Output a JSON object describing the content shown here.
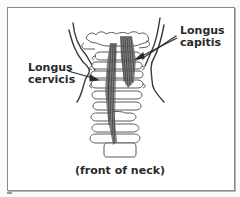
{
  "figure": {
    "type": "anatomical-illustration",
    "labels": {
      "longus_capitis": {
        "line1": "Longus",
        "line2": "capitis"
      },
      "longus_cervicis": {
        "line1": "Longus",
        "line2": "cervicis"
      }
    },
    "caption": "(front of neck)",
    "colors": {
      "frame_border": "#8a8a8a",
      "outline": "#3a3a3a",
      "muscle": "#555555",
      "text": "#2a2a2a",
      "background": "#ffffff"
    }
  }
}
